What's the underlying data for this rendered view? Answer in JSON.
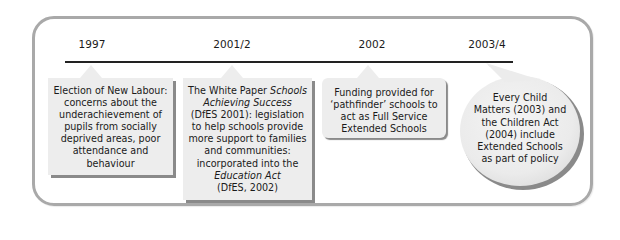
{
  "diagram": {
    "type": "timeline",
    "colors": {
      "frame_border": "#a9a9a9",
      "box_fill": "#ededed",
      "box_shadow": "#8a8a8a",
      "timeline": "#222222",
      "text": "#1a1a1a"
    },
    "events": [
      {
        "year": "1997",
        "shape": "rectangle-callout",
        "lines": [
          "Election of New Labour:",
          "concerns about the",
          "underachievement of",
          "pupils from socially",
          "deprived areas, poor",
          "attendance and",
          "behaviour"
        ]
      },
      {
        "year": "2001/2",
        "shape": "rectangle-callout",
        "line1_plain": "The White Paper ",
        "line1_italic": "Schools",
        "line2_italic": "Achieving Success",
        "lines_mid": [
          "(DfES 2001): legislation",
          "to help schools provide",
          "more support to families",
          "and communities:",
          "incorporated into the"
        ],
        "line_italic_end": "Education Act",
        "line_last": "(DfES, 2002)"
      },
      {
        "year": "2002",
        "shape": "rounded-callout",
        "lines": [
          "Funding provided for",
          "‘pathfinder’ schools to",
          "act as Full Service",
          "Extended Schools"
        ]
      },
      {
        "year": "2003/4",
        "shape": "speech-bubble",
        "lines": [
          "Every Child",
          "Matters (2003) and",
          "the Children Act",
          "(2004) include",
          "Extended Schools",
          "as part of policy"
        ]
      }
    ]
  }
}
